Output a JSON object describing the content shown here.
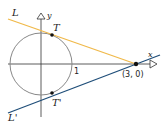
{
  "diagram": {
    "labels": {
      "line_L": "L",
      "line_L_prime": "L'",
      "point_T": "T",
      "point_T_prime": "T'",
      "x_axis": "x",
      "y_axis": "y",
      "radius_tick": "1",
      "external_point": "(3, 0)"
    },
    "colors": {
      "line_L": "#f0b94a",
      "line_L_prime": "#1f4e79",
      "circle": "#888888",
      "axes": "#333333",
      "points": "#111111"
    },
    "geometry": {
      "circle_center": [
        0,
        0
      ],
      "circle_radius": 1,
      "external_point": [
        3,
        0
      ],
      "tangent_points": [
        [
          0.333,
          0.943
        ],
        [
          0.333,
          -0.943
        ]
      ]
    }
  }
}
